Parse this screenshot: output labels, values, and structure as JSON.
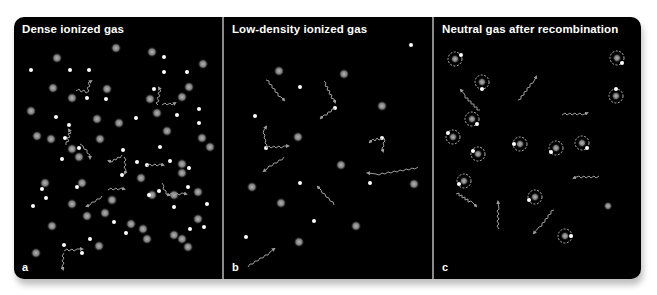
{
  "figure": {
    "panels": [
      {
        "id": "a",
        "title": "Dense ionized gas",
        "label": "a",
        "description": "Many protons (grey blurred) and free electrons (white dots); photons (wavy arrows) scatter frequently off electrons"
      },
      {
        "id": "b",
        "title": "Low-density ionized gas",
        "label": "b",
        "description": "Fewer protons and electrons; photons travel further between scatterings"
      },
      {
        "id": "c",
        "title": "Neutral gas after recombination",
        "label": "c",
        "description": "Electrons bound to protons forming neutral atoms (dashed orbit circles); photons travel freely"
      }
    ],
    "colors": {
      "background": "#000000",
      "frame_border": "#8a8a8a",
      "text": "#ffffff",
      "proton": "#9a9a9a",
      "electron": "#ffffff",
      "photon": "#9c9c9c"
    }
  }
}
